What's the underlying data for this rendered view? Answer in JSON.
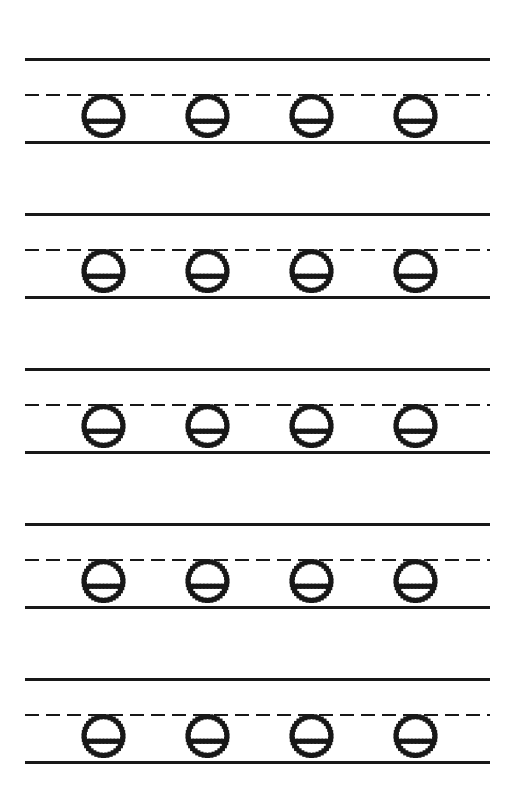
{
  "worksheet": {
    "title": "Lowercase Letter E Tracing Practice",
    "letter": "e",
    "letter_case": "lowercase",
    "page_width": 515,
    "page_height": 803,
    "background_color": "#ffffff",
    "ink_color": "#181818",
    "paper_style": "three-line handwriting rule",
    "row_count": 5,
    "letters_per_row": 4,
    "total_letters": 20,
    "guide_style": "dotted outline trace",
    "rule_geometry": {
      "left_margin": 25,
      "right_margin": 490,
      "line_length": 465,
      "solid_thickness": 3,
      "dashed_thickness": 2,
      "dash_length": 14,
      "dash_gap": 7,
      "top_to_mid": 35,
      "mid_to_base": 48,
      "group_pitch": 155
    },
    "glyph_geometry": {
      "diameter": 41,
      "dot_count_circle": 36,
      "dot_size": 2.4,
      "crossbar_dot_count": 10,
      "crossbar_height_ratio": 0.62
    },
    "rows": [
      {
        "index": 1,
        "top_line_y": 58,
        "dashed_line_y": 94,
        "baseline_y": 141,
        "letters": [
          {
            "index": 1,
            "glyph": "e",
            "center_x": 102
          },
          {
            "index": 2,
            "glyph": "e",
            "center_x": 206
          },
          {
            "index": 3,
            "glyph": "e",
            "center_x": 310
          },
          {
            "index": 4,
            "glyph": "e",
            "center_x": 414
          }
        ]
      },
      {
        "index": 2,
        "top_line_y": 213,
        "dashed_line_y": 249,
        "baseline_y": 296,
        "letters": [
          {
            "index": 1,
            "glyph": "e",
            "center_x": 102
          },
          {
            "index": 2,
            "glyph": "e",
            "center_x": 206
          },
          {
            "index": 3,
            "glyph": "e",
            "center_x": 310
          },
          {
            "index": 4,
            "glyph": "e",
            "center_x": 414
          }
        ]
      },
      {
        "index": 3,
        "top_line_y": 368,
        "dashed_line_y": 404,
        "baseline_y": 451,
        "letters": [
          {
            "index": 1,
            "glyph": "e",
            "center_x": 102
          },
          {
            "index": 2,
            "glyph": "e",
            "center_x": 206
          },
          {
            "index": 3,
            "glyph": "e",
            "center_x": 310
          },
          {
            "index": 4,
            "glyph": "e",
            "center_x": 414
          }
        ]
      },
      {
        "index": 4,
        "top_line_y": 523,
        "dashed_line_y": 559,
        "baseline_y": 606,
        "letters": [
          {
            "index": 1,
            "glyph": "e",
            "center_x": 102
          },
          {
            "index": 2,
            "glyph": "e",
            "center_x": 206
          },
          {
            "index": 3,
            "glyph": "e",
            "center_x": 310
          },
          {
            "index": 4,
            "glyph": "e",
            "center_x": 414
          }
        ]
      },
      {
        "index": 5,
        "top_line_y": 678,
        "dashed_line_y": 714,
        "baseline_y": 761,
        "letters": [
          {
            "index": 1,
            "glyph": "e",
            "center_x": 102
          },
          {
            "index": 2,
            "glyph": "e",
            "center_x": 206
          },
          {
            "index": 3,
            "glyph": "e",
            "center_x": 310
          },
          {
            "index": 4,
            "glyph": "e",
            "center_x": 414
          }
        ]
      }
    ]
  }
}
